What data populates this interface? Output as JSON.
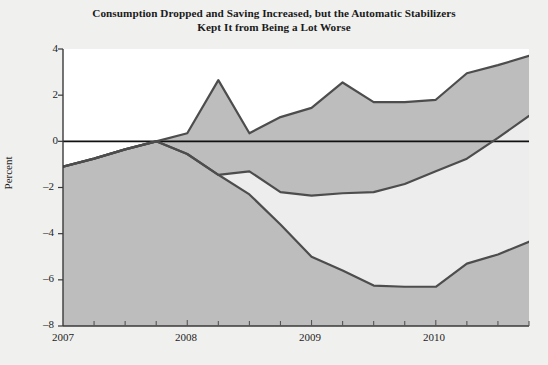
{
  "chart": {
    "title_line1": "Consumption Dropped and Saving Increased, but the Automatic Stabilizers",
    "title_line2": "Kept It from Being a Lot Worse",
    "ylabel": "Percent"
  },
  "chart_data": {
    "type": "area",
    "title": "Consumption Dropped and Saving Increased, but the Automatic Stabilizers Kept It from Being a Lot Worse",
    "xlabel": "",
    "ylabel": "Percent",
    "xlim": [
      2007.0,
      2010.75
    ],
    "ylim": [
      -8,
      4
    ],
    "yticks": [
      4,
      2,
      0,
      -2,
      -4,
      -6,
      -8
    ],
    "ytick_labels": [
      "4",
      "2",
      "0",
      "–2",
      "–4",
      "–6",
      "–8"
    ],
    "xticks": [
      2007,
      2008,
      2009,
      2010
    ],
    "xtick_labels": [
      "2007",
      "2008",
      "2009",
      "2010"
    ],
    "minor_xticks_per_year": 4,
    "grid": false,
    "legend": "annotations-on-plot",
    "zero_line": true,
    "x": [
      2007.0,
      2007.25,
      2007.5,
      2007.75,
      2008.0,
      2008.25,
      2008.5,
      2008.75,
      2009.0,
      2009.25,
      2009.5,
      2009.75,
      2010.0,
      2010.25,
      2010.5,
      2010.75
    ],
    "series": [
      {
        "name": "Real Personal Disposable Income",
        "label_line1": "Real Personal Disposable",
        "label_line2": "Income",
        "values": [
          -1.1,
          -0.75,
          -0.35,
          0.0,
          0.35,
          2.65,
          0.35,
          1.05,
          1.45,
          2.55,
          1.7,
          1.7,
          1.8,
          2.95,
          3.3,
          3.7
        ]
      },
      {
        "name": "Personal Consumption Expenditures",
        "label_line1": "Personal Consumption",
        "label_line2": "Expenditures",
        "values": [
          -1.1,
          -0.75,
          -0.35,
          0.0,
          -0.55,
          -1.45,
          -1.3,
          -2.2,
          -2.35,
          -2.25,
          -2.2,
          -1.85,
          -1.3,
          -0.75,
          0.15,
          1.1
        ]
      },
      {
        "name": "Real Personal Income Less Current Transfers",
        "label_line1": "Real Personal Income",
        "label_line2": "Less Current Transfers",
        "values": [
          -1.1,
          -0.75,
          -0.35,
          0.0,
          -0.55,
          -1.45,
          -2.3,
          -3.6,
          -5.0,
          -5.6,
          -6.25,
          -6.3,
          -6.3,
          -5.3,
          -4.9,
          -4.35
        ]
      }
    ],
    "colors": {
      "line": "#4d4d4d",
      "outer_fill": "#bdbdbd",
      "inner_band_fill": "#ededed",
      "above_zero_fill": "#bdbdbd",
      "plot_background": "#ffffff",
      "figure_background": "#f0f0ee",
      "zero_line": "#111111"
    }
  }
}
